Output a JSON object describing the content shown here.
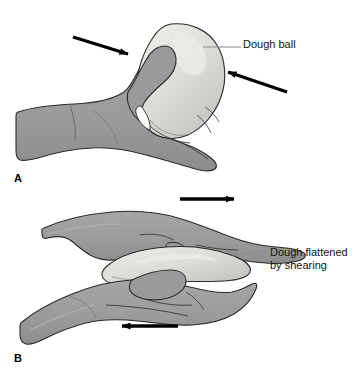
{
  "figure": {
    "background_color": "#ffffff",
    "width": 352,
    "height": 377
  },
  "colors": {
    "skin_fill": "#9a9a9a",
    "skin_shadow": "#8b8b8b",
    "skin_highlight": "#ababab",
    "dough_fill": "#d9d9d4",
    "dough_highlight": "#e8e8e3",
    "dough_shadow": "#c3c3bd",
    "outline": "#2b2b2b",
    "arrow": "#000000",
    "leader_line": "#8a8a8a",
    "text": "#111111"
  },
  "panels": [
    {
      "id": "panel-a",
      "letter": "A",
      "caption_label": "Dough ball",
      "description": "A hand grasping a rounded ball of dough, with two arrows showing inward compression from the left and the right.",
      "arrows": [
        {
          "name": "compression-arrow-left",
          "direction": "down-right"
        },
        {
          "name": "compression-arrow-right",
          "direction": "up-left"
        }
      ]
    },
    {
      "id": "panel-b",
      "letter": "B",
      "caption_label": "Dough flattened\nby shearing",
      "caption_line_1": "Dough flattened",
      "caption_line_2": "by shearing",
      "description": "Two hands sandwiching a flattened mass of dough, the upper hand moving right and the lower hand moving left, producing shear.",
      "arrows": [
        {
          "name": "shear-arrow-top",
          "direction": "right"
        },
        {
          "name": "shear-arrow-bottom",
          "direction": "left"
        }
      ]
    }
  ]
}
